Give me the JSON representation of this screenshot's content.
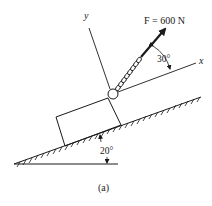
{
  "figure": {
    "caption": "(a)",
    "force_label": "F = 600 N",
    "force_angle_label": "30°",
    "incline_angle_label": "20°",
    "x_axis_label": "x",
    "y_axis_label": "y"
  },
  "colors": {
    "ink": "#1a1a1a",
    "background": "#ffffff"
  }
}
